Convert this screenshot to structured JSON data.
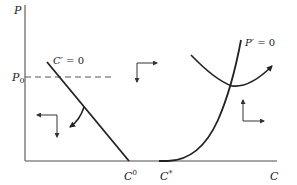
{
  "diagram": {
    "axes": {
      "y_label": "P",
      "x_label": "C",
      "y_level_label": "P",
      "y_level_subscript": "0"
    },
    "curves": {
      "c_prime_zero": {
        "label_main": "C",
        "label_rest": "′ = 0",
        "type": "straight-line-down-sloping"
      },
      "p_prime_zero": {
        "label_main": "P",
        "label_rest": "′ = 0",
        "type": "convex-rising"
      },
      "trajectory": {
        "type": "u-shaped-path-with-arrow"
      }
    },
    "x_ticks": {
      "c0_main": "C",
      "c0_sup": "0",
      "cstar_main": "C",
      "cstar_sup": "*"
    },
    "phase_arrows": [
      {
        "region": "lower-left",
        "directions": [
          "left",
          "down"
        ]
      },
      {
        "region": "upper-middle",
        "directions": [
          "right",
          "down"
        ]
      },
      {
        "region": "lower-right",
        "directions": [
          "up",
          "right"
        ]
      }
    ],
    "colors": {
      "axis": "#888888",
      "curve": "#222222",
      "dashed": "#555555"
    }
  }
}
